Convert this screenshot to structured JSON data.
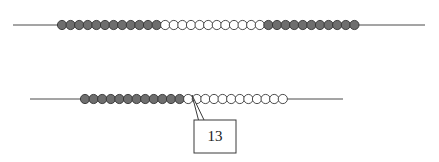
{
  "figure": {
    "title": "",
    "background_color": "#ffffff",
    "width": 439,
    "height": 162
  },
  "colors": {
    "bead_dark_fill": "#6e6e6e",
    "bead_dark_stroke": "#333333",
    "bead_light_fill": "#ffffff",
    "bead_light_stroke": "#3a3a3a",
    "axis_stroke": "#4a4a4a",
    "callout_stroke": "#3a3a3a",
    "text_color": "#1a1a1a"
  },
  "rows": [
    {
      "id": "row-top",
      "name": "top-bead-row",
      "axis": {
        "x1": 13,
        "x2": 425,
        "y": 25
      },
      "bead_radius": 4.6,
      "bead_spacing": 8.6,
      "first_bead_cx": 62,
      "bead_count": 35,
      "dark_count_left": 12,
      "light_count_middle": 12,
      "dark_count_right": 11,
      "pattern": [
        "dark",
        "dark",
        "dark",
        "dark",
        "dark",
        "dark",
        "dark",
        "dark",
        "dark",
        "dark",
        "dark",
        "dark",
        "light",
        "light",
        "light",
        "light",
        "light",
        "light",
        "light",
        "light",
        "light",
        "light",
        "light",
        "light",
        "dark",
        "dark",
        "dark",
        "dark",
        "dark",
        "dark",
        "dark",
        "dark",
        "dark",
        "dark",
        "dark"
      ]
    },
    {
      "id": "row-bottom",
      "name": "bottom-bead-row",
      "axis": {
        "x1": 30,
        "x2": 343,
        "y": 99
      },
      "bead_radius": 4.6,
      "bead_spacing": 8.6,
      "first_bead_cx": 85,
      "bead_count": 24,
      "dark_count_left": 12,
      "light_count_right": 12,
      "pattern": [
        "dark",
        "dark",
        "dark",
        "dark",
        "dark",
        "dark",
        "dark",
        "dark",
        "dark",
        "dark",
        "dark",
        "dark",
        "light",
        "light",
        "light",
        "light",
        "light",
        "light",
        "light",
        "light",
        "light",
        "light",
        "light",
        "light"
      ]
    }
  ],
  "callout": {
    "label": "13",
    "marked_row": "row-bottom",
    "marked_bead_index": 13,
    "pointer_tip": {
      "x": 192,
      "y": 95
    },
    "box": {
      "x": 194,
      "y": 120,
      "width": 42,
      "height": 33
    },
    "leader": {
      "points": "192,95 205,122 196,122 196,131 200,123 199,122"
    }
  }
}
